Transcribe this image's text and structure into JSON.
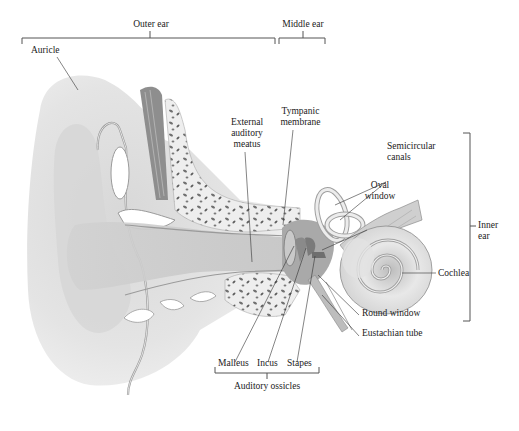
{
  "diagram": {
    "regions": {
      "outer_ear": "Outer ear",
      "middle_ear": "Middle ear",
      "inner_ear": [
        "Inner",
        "ear"
      ]
    },
    "labels": {
      "auricle": "Auricle",
      "external_auditory_meatus": [
        "External",
        "auditory",
        "meatus"
      ],
      "tympanic_membrane": [
        "Tympanic",
        "membrane"
      ],
      "semicircular_canals": [
        "Semicircular",
        "canals"
      ],
      "oval_window": [
        "Oval",
        "window"
      ],
      "cochlea": "Cochlea",
      "round_window": "Round window",
      "eustachian_tube": "Eustachian tube",
      "malleus": "Malleus",
      "incus": "Incus",
      "stapes": "Stapes",
      "auditory_ossicles": "Auditory ossicles"
    },
    "colors": {
      "tissue_light": "#e6e6e6",
      "tissue_mid": "#cfcfcf",
      "tissue_dark": "#9a9a9a",
      "bone": "#efefef",
      "bone_pores": "#6e6e6e",
      "leader_line": "#333333"
    }
  }
}
